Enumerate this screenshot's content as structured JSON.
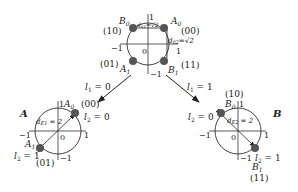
{
  "top": {
    "axis": {
      "x_pos": "1",
      "x_neg": "−1",
      "y_pos": "1",
      "y_neg": "−1",
      "origin": "0"
    },
    "points": [
      {
        "name": "A",
        "sub": "0",
        "code": "(00)"
      },
      {
        "name": "B",
        "sub": "0",
        "code": "(10)"
      },
      {
        "name": "A",
        "sub": "1",
        "code": "(01)"
      },
      {
        "name": "B",
        "sub": "1",
        "code": "(11)"
      }
    ],
    "dist_top": {
      "d": "d",
      "sub": "01",
      "val": "=√2"
    },
    "dist_right": {
      "d": "d",
      "sub": "02",
      "val": "=√2"
    }
  },
  "branches": {
    "left": {
      "l": "l",
      "sub": "1",
      "val": " = 0"
    },
    "right": {
      "l": "l",
      "sub": "1",
      "val": " = 1"
    }
  },
  "A": {
    "label": "A",
    "axis": {
      "x_pos": "1",
      "x_neg": "−1",
      "y_pos": "1",
      "y_neg": "−1",
      "origin": "0"
    },
    "points": [
      {
        "name": "A",
        "sub": "0",
        "code": "(00)",
        "l2": "l",
        "l2sub": "2",
        "l2val": " = 0"
      },
      {
        "name": "A",
        "sub": "1",
        "code": "(01)",
        "l2": "l",
        "l2sub": "2",
        "l2val": " = 1"
      }
    ],
    "dist": {
      "d": "d",
      "sub": "E1",
      "val": " = 2"
    }
  },
  "B": {
    "label": "B",
    "axis": {
      "x_pos": "1",
      "x_neg": "−1",
      "y_pos": "1",
      "y_neg": "−1",
      "origin": "0"
    },
    "points": [
      {
        "name": "B",
        "sub": "0",
        "code": "(10)",
        "l2": "l",
        "l2sub": "2",
        "l2val": " = 0"
      },
      {
        "name": "B",
        "sub": "1",
        "code": "(11)",
        "l2": "l",
        "l2sub": "2",
        "l2val": " = 1"
      }
    ],
    "dist": {
      "d": "d",
      "sub": "E2",
      "val": " = 2"
    }
  }
}
